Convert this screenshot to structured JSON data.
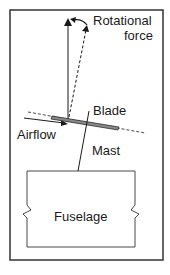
{
  "diagram": {
    "labels": {
      "rotational_force_line1": "Rotational",
      "rotational_force_line2": "force",
      "blade": "Blade",
      "airflow": "Airflow",
      "mast": "Mast",
      "fuselage": "Fuselage"
    },
    "colors": {
      "line": "#1a1a1a",
      "blade_fill": "#888888",
      "border": "#333333"
    }
  }
}
